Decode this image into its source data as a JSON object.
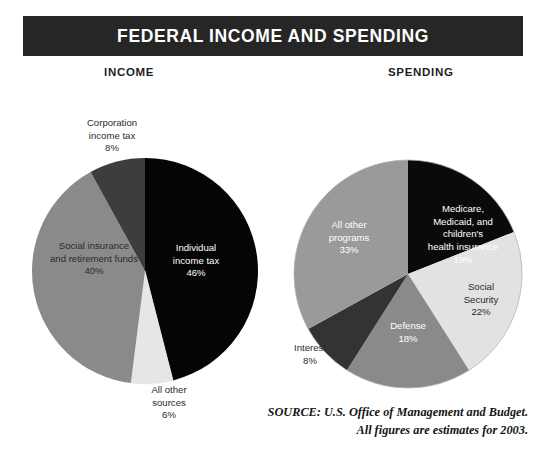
{
  "header": {
    "title": "FEDERAL INCOME AND SPENDING",
    "bar_color": "#262626",
    "text_color": "#ffffff"
  },
  "sections": {
    "income_heading": "INCOME",
    "spending_heading": "SPENDING"
  },
  "source": {
    "line1": "SOURCE: U.S. Office of Management and Budget.",
    "line2": "All figures are estimates for 2003."
  },
  "chart_data": [
    {
      "type": "pie",
      "title": "INCOME",
      "id": "federal-income",
      "start_angle_deg": 0,
      "direction": "clockwise",
      "labels": [
        "Individual income tax",
        "All other sources",
        "Social insurance and retirement funds",
        "Corporation income tax"
      ],
      "values": [
        46,
        6,
        40,
        8
      ],
      "value_labels": [
        "46%",
        "6%",
        "40%",
        "8%"
      ],
      "colors": [
        "#050505",
        "#e6e6e6",
        "#8a8a8a",
        "#3d3d3d"
      ],
      "label_placement": [
        "inside",
        "outside",
        "inside",
        "outside"
      ],
      "units": "percent of total federal income",
      "slices": [
        {
          "name": "Individual income tax",
          "label_line1": "Individual",
          "label_line2": "income tax",
          "percent": "46%",
          "value": 46,
          "color": "#050505"
        },
        {
          "name": "All other sources",
          "label_line1": "All other",
          "label_line2": "sources",
          "percent": "6%",
          "value": 6,
          "color": "#e6e6e6"
        },
        {
          "name": "Social insurance and retirement funds",
          "label_line1": "Social insurance",
          "label_line2": "and retirement funds",
          "percent": "40%",
          "value": 40,
          "color": "#8a8a8a"
        },
        {
          "name": "Corporation income tax",
          "label_line1": "Corporation",
          "label_line2": "income tax",
          "percent": "8%",
          "value": 8,
          "color": "#3d3d3d"
        }
      ]
    },
    {
      "type": "pie",
      "title": "SPENDING",
      "id": "federal-spending",
      "start_angle_deg": 0,
      "direction": "clockwise",
      "labels": [
        "Medicare, Medicaid, and children's health insurance",
        "Social Security",
        "Defense",
        "Interest",
        "All other programs"
      ],
      "values": [
        19,
        22,
        18,
        8,
        33
      ],
      "value_labels": [
        "19%",
        "22%",
        "18%",
        "8%",
        "33%"
      ],
      "colors": [
        "#0a0a0a",
        "#e2e2e2",
        "#8a8a8a",
        "#333333",
        "#9a9a9a"
      ],
      "label_placement": [
        "inside",
        "inside",
        "inside",
        "outside",
        "inside"
      ],
      "units": "percent of total federal spending",
      "slices": [
        {
          "name": "Medicare, Medicaid, and children's health insurance",
          "label_line1": "Medicare,",
          "label_line2": "Medicaid, and",
          "label_line3": "children's",
          "label_line4": "health insurance",
          "percent": "19%",
          "value": 19,
          "color": "#0a0a0a"
        },
        {
          "name": "Social Security",
          "label_line1": "Social",
          "label_line2": "Security",
          "percent": "22%",
          "value": 22,
          "color": "#e2e2e2"
        },
        {
          "name": "Defense",
          "label_line1": "Defense",
          "percent": "18%",
          "value": 18,
          "color": "#8a8a8a"
        },
        {
          "name": "Interest",
          "label_line1": "Interest",
          "percent": "8%",
          "value": 8,
          "color": "#333333"
        },
        {
          "name": "All other programs",
          "label_line1": "All other",
          "label_line2": "programs",
          "percent": "33%",
          "value": 33,
          "color": "#9a9a9a"
        }
      ]
    }
  ],
  "labels": {
    "income": {
      "individual": "Individual\nincome tax\n46%",
      "all_other_sources": "All other\nsources\n6%",
      "social_insurance": "Social insurance\nand retirement funds\n40%",
      "corporation": "Corporation\nincome tax\n8%"
    },
    "spending": {
      "medicare": "Medicare,\nMedicaid, and\nchildren's\nhealth insurance\n19%",
      "social_security": "Social\nSecurity\n22%",
      "defense": "Defense\n18%",
      "interest": "Interest\n8%",
      "all_other_programs": "All other\nprograms\n33%"
    }
  }
}
